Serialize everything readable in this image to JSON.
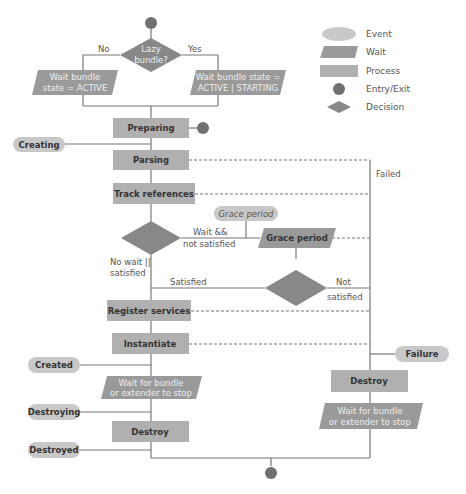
{
  "colors": {
    "event": "#c8c8c8",
    "wait": "#9a9a9a",
    "process": "#b0b0b0",
    "entry_exit": "#707070",
    "decision": "#888888",
    "line": "#777777"
  },
  "legend": {
    "items": [
      {
        "shape": "event",
        "label": "Event"
      },
      {
        "shape": "wait",
        "label": "Wait"
      },
      {
        "shape": "process",
        "label": "Process"
      },
      {
        "shape": "entry-exit",
        "label": "Entry/Exit"
      },
      {
        "shape": "decision",
        "label": "Decision"
      }
    ]
  },
  "nodes": {
    "lazy_decision": {
      "line1": "Lazy",
      "line2": "bundle?"
    },
    "no_label": "No",
    "yes_label": "Yes",
    "wait_active": {
      "line1": "Wait bundle",
      "line2": "state = ACTIVE"
    },
    "wait_active_starting": {
      "line1": "Wait bundle state =",
      "line2": "ACTIVE | STARTING"
    },
    "preparing": "Preparing",
    "creating_event": "Creating",
    "parsing": "Parsing",
    "track_references": "Track references",
    "failed_label": "Failed",
    "grace_period_event": "Grace period",
    "wait_not_satisfied": {
      "line1": "Wait &&",
      "line2": "not satisfied"
    },
    "grace_period_wait": "Grace period",
    "no_wait_satisfied": {
      "line1": "No wait ||",
      "line2": "satisfied"
    },
    "satisfied_label": "Satisfied",
    "not_satisfied": {
      "line1": "Not",
      "line2": "satisfied"
    },
    "register_services": "Register services",
    "instantiate": "Instantiate",
    "failure_event": "Failure",
    "created_event": "Created",
    "wait_stop_left": {
      "line1": "Wait for bundle",
      "line2": "or extender to stop"
    },
    "destroy_right": "Destroy",
    "destroying_event": "Destroying",
    "wait_stop_right": {
      "line1": "Wait for bundle",
      "line2": "or extender to stop"
    },
    "destroy_left": "Destroy",
    "destroyed_event": "Destroyed"
  }
}
